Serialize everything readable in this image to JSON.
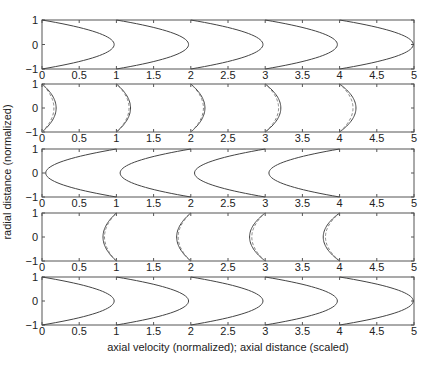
{
  "chart_data": {
    "type": "line",
    "title": "",
    "xlabel": "axial velocity (normalized);  axial distance (scaled)",
    "ylabel": "radial distance (normalized)",
    "grid": false,
    "legend": "none",
    "panels": [
      {
        "name": "panel-1",
        "xlim": [
          0,
          5
        ],
        "ylim": [
          -1,
          1
        ],
        "xticks": [
          0,
          0.5,
          1,
          1.5,
          2,
          2.5,
          3,
          3.5,
          4,
          4.5,
          5
        ],
        "xtick_labels": [
          "0",
          "0.5",
          "1",
          "1.5",
          "2",
          "2.5",
          "3",
          "3.5",
          "4",
          "4.5",
          "5"
        ],
        "yticks": [
          -1,
          0,
          1
        ],
        "ytick_labels": [
          "−1",
          "0",
          "1"
        ],
        "profiles": [
          {
            "base": 0,
            "amplitude": 0.97,
            "direction": 1,
            "style": "solid"
          },
          {
            "base": 1,
            "amplitude": 0.97,
            "direction": 1,
            "style": "solid"
          },
          {
            "base": 2,
            "amplitude": 0.97,
            "direction": 1,
            "style": "solid"
          },
          {
            "base": 3,
            "amplitude": 0.97,
            "direction": 1,
            "style": "solid"
          },
          {
            "base": 4,
            "amplitude": 0.99,
            "direction": 1,
            "style": "solid"
          }
        ]
      },
      {
        "name": "panel-2",
        "xlim": [
          0,
          5
        ],
        "ylim": [
          -1,
          1
        ],
        "xticks": [
          0,
          0.5,
          1,
          1.5,
          2,
          2.5,
          3,
          3.5,
          4,
          4.5,
          5
        ],
        "xtick_labels": [
          "0",
          "0.5",
          "1",
          "1.5",
          "2",
          "2.5",
          "3",
          "3.5",
          "4",
          "4.5",
          "5"
        ],
        "yticks": [
          -1,
          0,
          1
        ],
        "ytick_labels": [
          "−1",
          "0",
          "1"
        ],
        "profiles": [
          {
            "base": 0,
            "amplitude": 0.19,
            "direction": 1,
            "style": "solid"
          },
          {
            "base": 0,
            "amplitude": 0.16,
            "direction": 1,
            "style": "dashed"
          },
          {
            "base": 1,
            "amplitude": 0.19,
            "direction": 1,
            "style": "solid"
          },
          {
            "base": 1,
            "amplitude": 0.17,
            "direction": 1,
            "style": "dashed"
          },
          {
            "base": 2,
            "amplitude": 0.19,
            "direction": 1,
            "style": "solid"
          },
          {
            "base": 2,
            "amplitude": 0.17,
            "direction": 1,
            "style": "dashed"
          },
          {
            "base": 3,
            "amplitude": 0.21,
            "direction": 1,
            "style": "solid"
          },
          {
            "base": 3,
            "amplitude": 0.18,
            "direction": 1,
            "style": "dashed"
          },
          {
            "base": 4,
            "amplitude": 0.22,
            "direction": 1,
            "style": "solid"
          },
          {
            "base": 4,
            "amplitude": 0.18,
            "direction": 1,
            "style": "dashed"
          }
        ]
      },
      {
        "name": "panel-3",
        "xlim": [
          0,
          5
        ],
        "ylim": [
          -1,
          1
        ],
        "xticks": [
          0,
          0.5,
          1,
          1.5,
          2,
          2.5,
          3,
          3.5,
          4,
          4.5,
          5
        ],
        "xtick_labels": [
          "0",
          "0.5",
          "1",
          "1.5",
          "2",
          "2.5",
          "3",
          "3.5",
          "4",
          "4.5",
          "5"
        ],
        "yticks": [
          -1,
          0,
          1
        ],
        "ytick_labels": [
          "−1",
          "0",
          "1"
        ],
        "profiles": [
          {
            "base": 1,
            "amplitude": 0.95,
            "direction": -1,
            "style": "solid"
          },
          {
            "base": 2,
            "amplitude": 0.95,
            "direction": -1,
            "style": "solid"
          },
          {
            "base": 3,
            "amplitude": 0.95,
            "direction": -1,
            "style": "solid"
          },
          {
            "base": 4,
            "amplitude": 0.95,
            "direction": -1,
            "style": "solid"
          }
        ]
      },
      {
        "name": "panel-4",
        "xlim": [
          0,
          5
        ],
        "ylim": [
          -1,
          1
        ],
        "xticks": [
          0,
          0.5,
          1,
          1.5,
          2,
          2.5,
          3,
          3.5,
          4,
          4.5,
          5
        ],
        "xtick_labels": [
          "0",
          "0.5",
          "1",
          "1.5",
          "2",
          "2.5",
          "3",
          "3.5",
          "4",
          "4.5",
          "5"
        ],
        "yticks": [
          -1,
          0,
          1
        ],
        "ytick_labels": [
          "−1",
          "0",
          "1"
        ],
        "profiles": [
          {
            "base": 1,
            "amplitude": 0.18,
            "direction": -1,
            "style": "solid"
          },
          {
            "base": 1,
            "amplitude": 0.16,
            "direction": -1,
            "style": "dashed"
          },
          {
            "base": 2,
            "amplitude": 0.19,
            "direction": -1,
            "style": "solid"
          },
          {
            "base": 2,
            "amplitude": 0.17,
            "direction": -1,
            "style": "dashed"
          },
          {
            "base": 3,
            "amplitude": 0.21,
            "direction": -1,
            "style": "solid"
          },
          {
            "base": 3,
            "amplitude": 0.18,
            "direction": -1,
            "style": "dashed"
          },
          {
            "base": 4,
            "amplitude": 0.22,
            "direction": -1,
            "style": "solid"
          },
          {
            "base": 4,
            "amplitude": 0.19,
            "direction": -1,
            "style": "dashed"
          }
        ]
      },
      {
        "name": "panel-5",
        "xlim": [
          0,
          5
        ],
        "ylim": [
          -1,
          1
        ],
        "xticks": [
          0,
          0.5,
          1,
          1.5,
          2,
          2.5,
          3,
          3.5,
          4,
          4.5,
          5
        ],
        "xtick_labels": [
          "0",
          "0.5",
          "1",
          "1.5",
          "2",
          "2.5",
          "3",
          "3.5",
          "4",
          "4.5",
          "5"
        ],
        "yticks": [
          -1,
          0,
          1
        ],
        "ytick_labels": [
          "−1",
          "0",
          "1"
        ],
        "profiles": [
          {
            "base": 0,
            "amplitude": 0.97,
            "direction": 1,
            "style": "solid"
          },
          {
            "base": 1,
            "amplitude": 0.97,
            "direction": 1,
            "style": "solid"
          },
          {
            "base": 2,
            "amplitude": 0.97,
            "direction": 1,
            "style": "solid"
          },
          {
            "base": 3,
            "amplitude": 0.97,
            "direction": 1,
            "style": "solid"
          },
          {
            "base": 4,
            "amplitude": 0.99,
            "direction": 1,
            "style": "solid"
          }
        ]
      }
    ]
  }
}
